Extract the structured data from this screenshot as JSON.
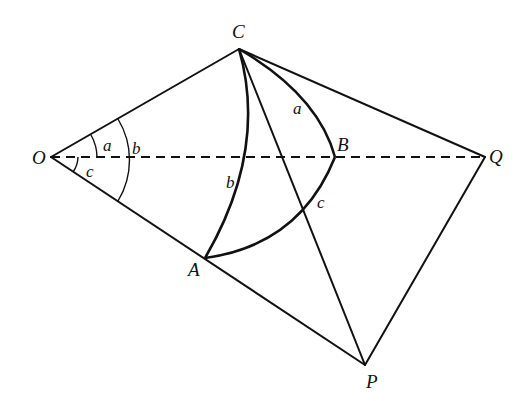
{
  "diagram": {
    "points": {
      "O": {
        "label": "O",
        "x": 51,
        "y": 157
      },
      "C": {
        "label": "C",
        "x": 239,
        "y": 49
      },
      "A": {
        "label": "A",
        "x": 205,
        "y": 258
      },
      "B": {
        "label": "B",
        "x": 335,
        "y": 157
      },
      "Q": {
        "label": "Q",
        "x": 485,
        "y": 157
      },
      "P": {
        "label": "P",
        "x": 365,
        "y": 365
      }
    },
    "segments": [
      {
        "from": "O",
        "to": "C",
        "style": "solid"
      },
      {
        "from": "O",
        "to": "P",
        "style": "solid"
      },
      {
        "from": "O",
        "to": "Q",
        "style": "dashed"
      },
      {
        "from": "C",
        "to": "Q",
        "style": "solid"
      },
      {
        "from": "C",
        "to": "P",
        "style": "solid"
      },
      {
        "from": "Q",
        "to": "P",
        "style": "solid"
      }
    ],
    "great_circle_arcs": [
      {
        "from": "C",
        "to": "B",
        "label": "a"
      },
      {
        "from": "C",
        "to": "A",
        "label": "b"
      },
      {
        "from": "A",
        "to": "B",
        "label": "c"
      }
    ],
    "angle_marks_at_O": [
      {
        "label": "a",
        "between": [
          "OC",
          "OQ"
        ]
      },
      {
        "label": "b",
        "between": [
          "OC",
          "OP"
        ]
      },
      {
        "label": "c",
        "between": [
          "OQ",
          "OP"
        ]
      }
    ],
    "labels": {
      "O": "O",
      "C": "C",
      "A": "A",
      "B": "B",
      "Q": "Q",
      "P": "P",
      "arc_a": "a",
      "arc_b": "b",
      "arc_c": "c",
      "angle_a": "a",
      "angle_b": "b",
      "angle_c": "c"
    },
    "colors": {
      "stroke": "#111111",
      "background": "#ffffff"
    }
  }
}
